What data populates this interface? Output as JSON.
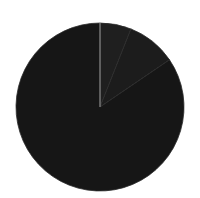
{
  "chart_data": {
    "type": "pie",
    "title": "",
    "labels": [
      "Slice A",
      "Slice B",
      "Slice C"
    ],
    "values": [
      6,
      9.5,
      84.5
    ],
    "colors": [
      "#1f1f1f",
      "#1c1c1c",
      "#161616"
    ],
    "start_angle_deg": 0,
    "direction": "clockwise",
    "legend": "none",
    "stroke": {
      "start_line_color": "#9a9a9a",
      "slice_edge_color": "#2c2c2c"
    },
    "geometry": {
      "cx": 100,
      "cy": 107,
      "r": 84
    }
  }
}
